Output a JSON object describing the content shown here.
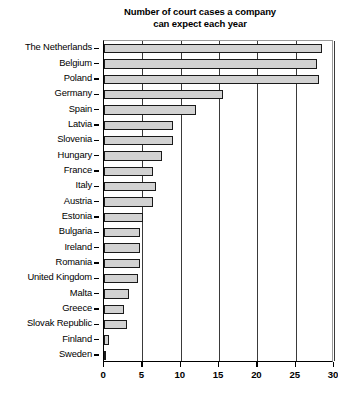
{
  "chart_data": {
    "type": "bar",
    "orientation": "horizontal",
    "title": "Number of court cases a company can expect each year",
    "title_lines": [
      "Number of court cases a company",
      "can expect each year"
    ],
    "xlabel": "",
    "ylabel": "",
    "xlim": [
      0,
      30
    ],
    "xticks": [
      0,
      5,
      10,
      15,
      20,
      25,
      30
    ],
    "xtick_labels": [
      "0",
      "5",
      "10",
      "15",
      "20",
      "25",
      "30"
    ],
    "grid": true,
    "legend": false,
    "bar_fill_color": "#d2d2d2",
    "bar_edge_color": "#1a1a1a",
    "categories": [
      "The Netherlands",
      "Belgium",
      "Poland",
      "Germany",
      "Spain",
      "Latvia",
      "Slovenia",
      "Hungary",
      "France",
      "Italy",
      "Austria",
      "Estonia",
      "Bulgaria",
      "Ireland",
      "Romania",
      "United Kingdom",
      "Malta",
      "Greece",
      "Slovak Republic",
      "Finland",
      "Sweden"
    ],
    "values": [
      28.4,
      27.8,
      28.0,
      15.5,
      12.0,
      9.0,
      9.0,
      7.5,
      6.4,
      6.8,
      6.4,
      5.1,
      4.7,
      4.7,
      4.7,
      4.4,
      3.3,
      2.6,
      3.0,
      0.6,
      0.2
    ]
  }
}
